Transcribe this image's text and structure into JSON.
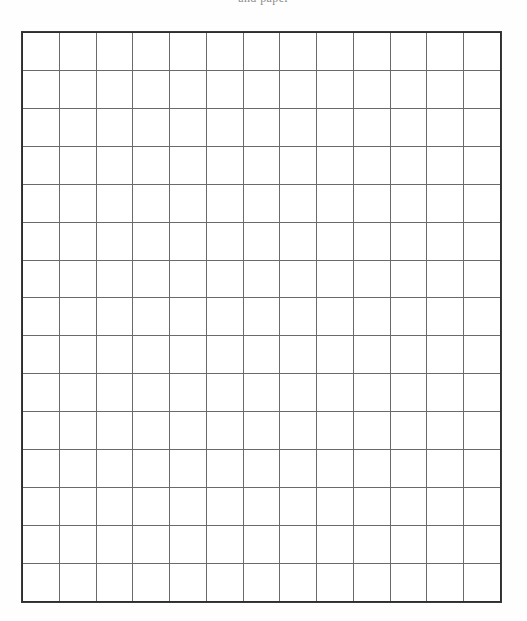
{
  "page": {
    "background_color": "#fefefe",
    "width": 527,
    "height": 621
  },
  "header": {
    "clipped_text": "and paper",
    "note": "text is cut off by the top edge of the page; only descenders visible"
  },
  "grid": {
    "label": "blank grid",
    "columns": 13,
    "rows": 15,
    "cell_width": 37,
    "cell_height": 38,
    "line_color": "#6a6a6a",
    "border_color": "#2e2e2e",
    "cell_fill": "#ffffff",
    "cells_empty": true,
    "cell_values": [
      [
        "",
        "",
        "",
        "",
        "",
        "",
        "",
        "",
        "",
        "",
        "",
        "",
        ""
      ],
      [
        "",
        "",
        "",
        "",
        "",
        "",
        "",
        "",
        "",
        "",
        "",
        "",
        ""
      ],
      [
        "",
        "",
        "",
        "",
        "",
        "",
        "",
        "",
        "",
        "",
        "",
        "",
        ""
      ],
      [
        "",
        "",
        "",
        "",
        "",
        "",
        "",
        "",
        "",
        "",
        "",
        "",
        ""
      ],
      [
        "",
        "",
        "",
        "",
        "",
        "",
        "",
        "",
        "",
        "",
        "",
        "",
        ""
      ],
      [
        "",
        "",
        "",
        "",
        "",
        "",
        "",
        "",
        "",
        "",
        "",
        "",
        ""
      ],
      [
        "",
        "",
        "",
        "",
        "",
        "",
        "",
        "",
        "",
        "",
        "",
        "",
        ""
      ],
      [
        "",
        "",
        "",
        "",
        "",
        "",
        "",
        "",
        "",
        "",
        "",
        "",
        ""
      ],
      [
        "",
        "",
        "",
        "",
        "",
        "",
        "",
        "",
        "",
        "",
        "",
        "",
        ""
      ],
      [
        "",
        "",
        "",
        "",
        "",
        "",
        "",
        "",
        "",
        "",
        "",
        "",
        ""
      ],
      [
        "",
        "",
        "",
        "",
        "",
        "",
        "",
        "",
        "",
        "",
        "",
        "",
        ""
      ],
      [
        "",
        "",
        "",
        "",
        "",
        "",
        "",
        "",
        "",
        "",
        "",
        "",
        ""
      ],
      [
        "",
        "",
        "",
        "",
        "",
        "",
        "",
        "",
        "",
        "",
        "",
        "",
        ""
      ],
      [
        "",
        "",
        "",
        "",
        "",
        "",
        "",
        "",
        "",
        "",
        "",
        "",
        ""
      ],
      [
        "",
        "",
        "",
        "",
        "",
        "",
        "",
        "",
        "",
        "",
        "",
        "",
        ""
      ]
    ]
  }
}
